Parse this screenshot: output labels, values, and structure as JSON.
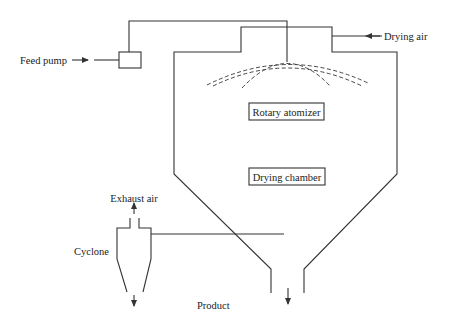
{
  "diagram": {
    "labels": {
      "feed_pump": "Feed pump",
      "drying_air": "Drying air",
      "rotary_atomizer": "Rotary atomizer",
      "drying_chamber": "Drying chamber",
      "exhaust_air": "Exhaust air",
      "cyclone": "Cyclone",
      "product": "Product"
    },
    "colors": {
      "line": "#333333",
      "text": "#222222",
      "background": "#ffffff"
    }
  }
}
